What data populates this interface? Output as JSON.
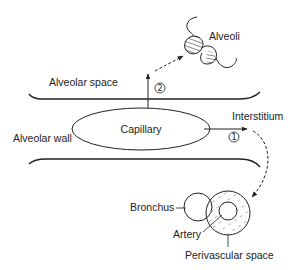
{
  "labels": {
    "alveoli": "Alveoli",
    "alveolar_space": "Alveolar space",
    "capillary": "Capillary",
    "interstitium": "Interstitium",
    "alveolar_wall": "Alveolar wall",
    "bronchus": "Bronchus",
    "artery": "Artery",
    "perivascular_space": "Perivascular space"
  },
  "pathways": {
    "one": "1",
    "two": "2"
  },
  "colors": {
    "stroke": "#222222",
    "background": "#ffffff"
  }
}
